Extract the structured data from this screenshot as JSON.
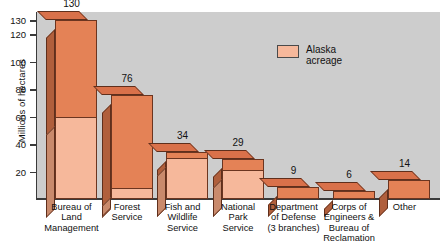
{
  "chart_data": {
    "type": "bar",
    "title": "",
    "subtitle": "",
    "xlabel": "",
    "ylabel": "Millions of hectares",
    "ylim": [
      0,
      136
    ],
    "grid": false,
    "legend_position": "inside-top-right",
    "stacked": true,
    "categories": [
      "Bureau of\nLand\nManagement",
      "Forest\nService",
      "Fish and\nWildlife\nService",
      "National\nPark\nService",
      "Department\nof Defense\n(3 branches)",
      "Corps of\nEngineers &\nBureau of\nReclamation",
      "Other"
    ],
    "tick_labels": [
      "130",
      "120",
      "100",
      "80",
      "60",
      "40",
      "20"
    ],
    "tick_values": [
      130,
      120,
      100,
      80,
      60,
      40,
      20
    ],
    "series": [
      {
        "name": "Total acreage",
        "values": [
          130,
          76,
          34,
          29,
          9,
          6,
          14
        ],
        "color": "#e48256"
      },
      {
        "name": "Alaska acreage",
        "values": [
          60,
          8,
          30,
          21,
          null,
          null,
          null
        ],
        "color": "#f6b89b"
      }
    ],
    "legend": [
      {
        "label": "Alaska\nacreage",
        "color": "#f6b89b"
      }
    ],
    "annotations": {
      "total_labels": [
        "130",
        "76",
        "34",
        "29",
        "9",
        "6",
        "14"
      ],
      "alaska_labels": [
        "60",
        "8",
        "30",
        "21",
        "",
        "",
        ""
      ]
    },
    "colors": {
      "plot_background": "#cdcdcd",
      "page_background": "#ffffff",
      "bar_front": "#e48256",
      "bar_alaska": "#f6b89b",
      "bar_side": "#b05f3c",
      "bar_top": "#d9714a",
      "axis": "#3a3a3a",
      "text": "#111111"
    }
  }
}
